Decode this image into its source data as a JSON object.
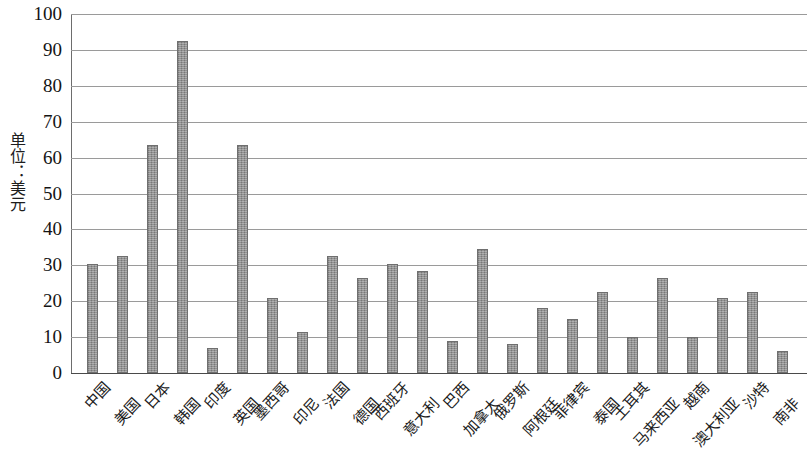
{
  "chart_data": {
    "type": "bar",
    "title": "",
    "xlabel": "",
    "ylabel": "单位：美元",
    "ylim": [
      0,
      100
    ],
    "ytick_step": 10,
    "grid": true,
    "legend": "none",
    "bar_color": "#8d8d8d",
    "bar_border_color": "#6f6f6f",
    "gridline_color": "#9a9a9a",
    "axis_color": "#4a4a4a",
    "ytick_labels": [
      "100",
      "90",
      "80",
      "70",
      "60",
      "50",
      "40",
      "30",
      "20",
      "10",
      "0"
    ],
    "categories": [
      "中国",
      "美国",
      "日本",
      "韩国",
      "印度",
      "英国",
      "墨西哥",
      "印尼",
      "法国",
      "德国",
      "西班牙",
      "意大利",
      "巴西",
      "加拿大",
      "俄罗斯",
      "阿根廷",
      "菲律宾",
      "泰国",
      "土耳其",
      "马来西亚",
      "越南",
      "澳大利亚",
      "沙特",
      "南非"
    ],
    "values": [
      30.5,
      32.5,
      63.5,
      92.5,
      7,
      63.5,
      21,
      11.5,
      32.5,
      26.5,
      30.5,
      28.5,
      9,
      34.5,
      8,
      18,
      15,
      22.5,
      10,
      26.5,
      10,
      21,
      22.5,
      6
    ]
  }
}
